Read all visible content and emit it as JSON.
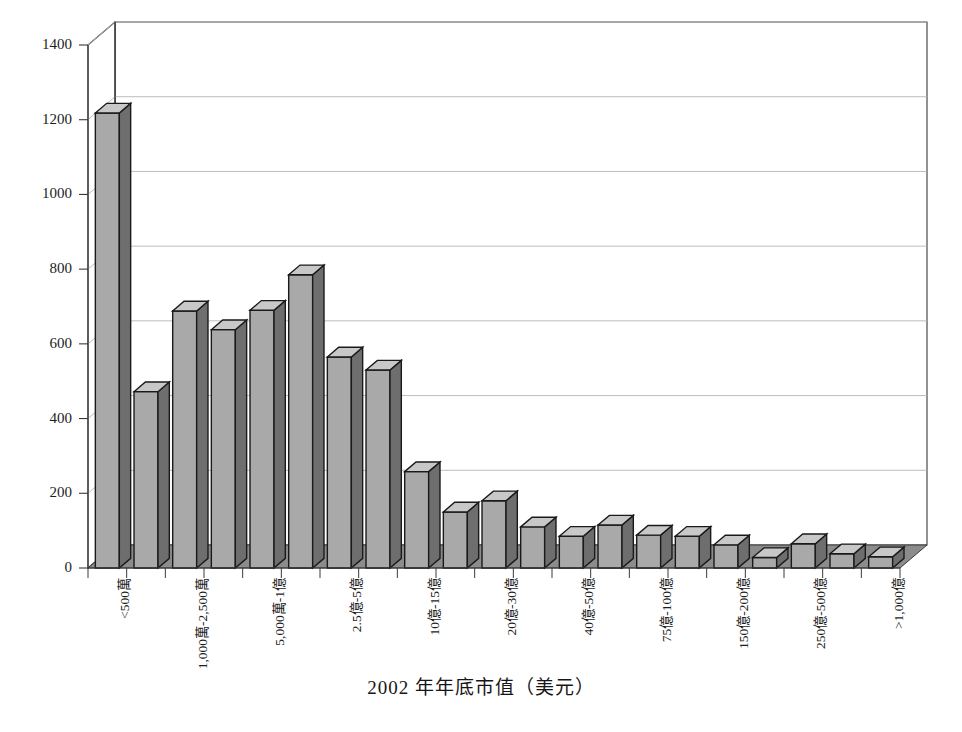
{
  "chart_data": {
    "type": "bar",
    "title": "",
    "xlabel": "2002 年年底市值（美元）",
    "ylabel": "",
    "ylim": [
      0,
      1400
    ],
    "yticks": [
      0,
      200,
      400,
      600,
      800,
      1000,
      1200,
      1400
    ],
    "grid": true,
    "legend": "none",
    "style3d": true,
    "categories": [
      "<500萬",
      "",
      "1,000萬-2,500萬",
      "",
      "5,000萬-1億",
      "",
      "2.5億-5億",
      "",
      "10億-15億",
      "",
      "20億-30億",
      "",
      "40億-50億",
      "",
      "75億-100億",
      "",
      "150億-200億",
      "",
      "250億-500億",
      "",
      ">1,000億"
    ],
    "tick_labels": [
      "<500萬",
      "1,000萬-2,500萬",
      "5,000萬-1億",
      "2.5億-5億",
      "10億-15億",
      "20億-30億",
      "40億-50億",
      "75億-100億",
      "150億-200億",
      "250億-500億",
      ">1,000億"
    ],
    "labeled_indices": [
      0,
      2,
      4,
      6,
      8,
      10,
      12,
      14,
      16,
      18,
      20
    ],
    "values": [
      1218,
      472,
      688,
      638,
      690,
      785,
      565,
      530,
      258,
      150,
      180,
      110,
      85,
      115,
      88,
      85,
      62,
      28,
      65,
      38,
      30
    ],
    "bar_fill": "#a9a9a9",
    "bar_side": "#6e6e6e",
    "bar_top": "#c8c8c8",
    "bar_edge": "#1a1a1a",
    "floor_color": "#8c8c8c",
    "wall_color": "#ffffff",
    "grid_color": "#b5b5b5",
    "axis_color": "#3a3a3a"
  }
}
